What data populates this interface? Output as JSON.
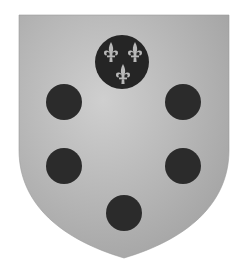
{
  "image": {
    "subject": "Coat of arms with six balls (palle), the top one charged with three fleurs-de-lis",
    "colors": {
      "background": "#ffffff",
      "field_light": "#c8c8c8",
      "field_dark": "#a8a8a8",
      "ball": "#2a2a2a",
      "fleur": "#b5b5b5"
    }
  }
}
